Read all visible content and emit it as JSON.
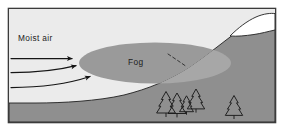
{
  "figure": {
    "kind": "orographic-fog-diagram",
    "labels": {
      "moist_air": "Moist air",
      "fog": "Fog"
    },
    "colors": {
      "frame_border": "#3b3b3b",
      "sky": "#ebebeb",
      "ground": "#8f8f8f",
      "fog_front": "#9a9a9a",
      "fog_behind": "#a8a8a8",
      "snow": "#ffffff",
      "ink": "#1c1c1c",
      "page": "#ffffff"
    },
    "elements": {
      "arrow_count": 3,
      "tree_count": 5,
      "hidden_boundary_style": "dashed",
      "snowcap": "present"
    }
  }
}
